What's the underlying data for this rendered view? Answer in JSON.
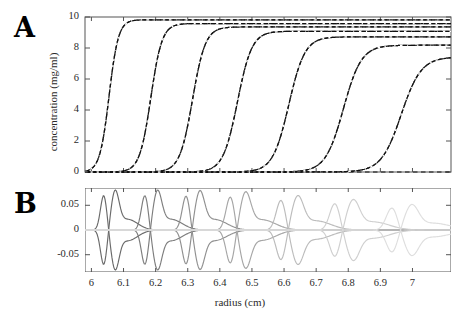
{
  "figure": {
    "panel_a_letter": "A",
    "panel_b_letter": "B",
    "xlabel": "radius (cm)",
    "ylabel_a": "concentration (mg/ml)"
  },
  "chart_data": [
    {
      "type": "line",
      "panel": "A",
      "title": "",
      "xlabel": "radius (cm)",
      "ylabel": "concentration (mg/ml)",
      "xlim": [
        5.98,
        7.12
      ],
      "ylim": [
        0,
        10
      ],
      "xticks": [
        6,
        6.1,
        6.2,
        6.3,
        6.4,
        6.5,
        6.6,
        6.7,
        6.8,
        6.9,
        7
      ],
      "xtick_labels": [
        "6",
        "6.1",
        "6.2",
        "6.3",
        "6.4",
        "6.5",
        "6.6",
        "6.7",
        "6.8",
        "6.9",
        "7"
      ],
      "yticks": [
        0,
        2,
        4,
        6,
        8,
        10
      ],
      "ytick_labels": [
        "0",
        "2",
        "4",
        "6",
        "8",
        "10"
      ],
      "grid": false,
      "legend": "none",
      "linestyle": "dashed-over-solid",
      "series": [
        {
          "name": "scan 1",
          "midpoint": 6.055,
          "plateau": 9.82,
          "steepness": 0.0145,
          "color": "#000000"
        },
        {
          "name": "scan 2",
          "midpoint": 6.185,
          "plateau": 9.58,
          "steepness": 0.0175,
          "color": "#000000"
        },
        {
          "name": "scan 3",
          "midpoint": 6.315,
          "plateau": 9.36,
          "steepness": 0.02,
          "color": "#000000"
        },
        {
          "name": "scan 4",
          "midpoint": 6.455,
          "plateau": 9.08,
          "steepness": 0.0225,
          "color": "#000000"
        },
        {
          "name": "scan 5",
          "midpoint": 6.615,
          "plateau": 8.72,
          "steepness": 0.025,
          "color": "#000000"
        },
        {
          "name": "scan 6",
          "midpoint": 6.785,
          "plateau": 8.18,
          "steepness": 0.028,
          "color": "#000000"
        },
        {
          "name": "scan 7",
          "midpoint": 6.965,
          "plateau": 7.42,
          "steepness": 0.031,
          "color": "#000000"
        }
      ],
      "baseline": {
        "name": "zero baseline",
        "value": 0,
        "style": "dashed"
      }
    },
    {
      "type": "line",
      "panel": "B",
      "title": "",
      "xlabel": "radius (cm)",
      "ylabel": "",
      "xlim": [
        5.98,
        7.12
      ],
      "ylim": [
        -0.085,
        0.085
      ],
      "xticks": [
        6,
        6.1,
        6.2,
        6.3,
        6.4,
        6.5,
        6.6,
        6.7,
        6.8,
        6.9,
        7
      ],
      "xtick_labels": [
        "6",
        "6.1",
        "6.2",
        "6.3",
        "6.4",
        "6.5",
        "6.6",
        "6.7",
        "6.8",
        "6.9",
        "7"
      ],
      "yticks": [
        -0.05,
        0,
        0.05
      ],
      "ytick_labels": [
        "-0.05",
        "0",
        "0.05"
      ],
      "grid": false,
      "legend": "none",
      "description": "residual oscillations, amplitude decaying and color fading with radius",
      "series": [
        {
          "name": "residual 1",
          "midpoint": 6.055,
          "amplitude": 0.072,
          "width": 0.03,
          "gray": "#6a6a6a"
        },
        {
          "name": "residual 2",
          "midpoint": 6.185,
          "amplitude": 0.072,
          "width": 0.033,
          "gray": "#7d7d7d"
        },
        {
          "name": "residual 3",
          "midpoint": 6.315,
          "amplitude": 0.071,
          "width": 0.036,
          "gray": "#909090"
        },
        {
          "name": "residual 4",
          "midpoint": 6.455,
          "amplitude": 0.069,
          "width": 0.04,
          "gray": "#a6a6a6"
        },
        {
          "name": "residual 5",
          "midpoint": 6.615,
          "amplitude": 0.062,
          "width": 0.044,
          "gray": "#bcbcbc"
        },
        {
          "name": "residual 6",
          "midpoint": 6.785,
          "amplitude": 0.055,
          "width": 0.048,
          "gray": "#cfcfcf"
        },
        {
          "name": "residual 7",
          "midpoint": 6.965,
          "amplitude": 0.046,
          "width": 0.052,
          "gray": "#dedede"
        }
      ],
      "baseline": {
        "name": "zero line",
        "value": 0,
        "style": "solid-light"
      }
    }
  ]
}
